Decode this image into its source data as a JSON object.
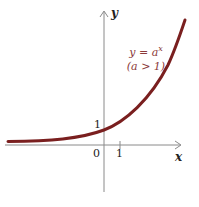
{
  "diagram": {
    "axes": {
      "x_label": "x",
      "y_label": "y",
      "origin_label": "0",
      "x_tick_label": "1",
      "y_intercept_label": "1"
    },
    "curve": {
      "equation": "y = a",
      "exponent": "x",
      "condition": "(a > 1)",
      "color": "#7a1f1f"
    },
    "axis_color": "#8a8a8a"
  }
}
